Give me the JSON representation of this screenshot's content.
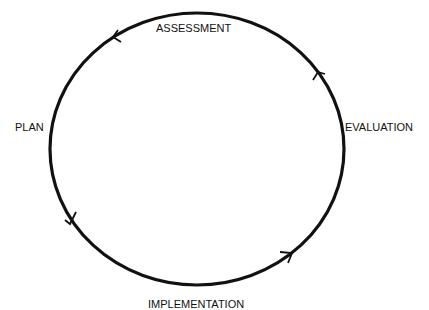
{
  "diagram": {
    "type": "cycle",
    "stages": [
      {
        "id": "assessment",
        "label": "ASSESSMENT"
      },
      {
        "id": "evaluation",
        "label": "EVALUATION"
      },
      {
        "id": "implementation",
        "label": "IMPLEMENTATION"
      },
      {
        "id": "plan",
        "label": "PLAN"
      }
    ],
    "colors": {
      "stroke": "#111111",
      "text": "#111111",
      "background": "#ffffff"
    }
  }
}
